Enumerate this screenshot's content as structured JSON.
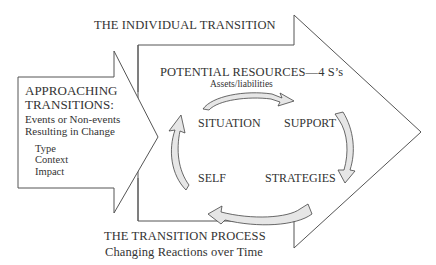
{
  "diagram": {
    "individual_transition": {
      "label": "THE INDIVIDUAL TRANSITION"
    },
    "approaching": {
      "title_line1": "APPROACHING",
      "title_line2": "TRANSITIONS:",
      "sub_line1": "Events or Non-events",
      "sub_line2": "Resulting in Change",
      "factors": [
        "Type",
        "Context",
        "Impact"
      ]
    },
    "resources": {
      "title": "POTENTIAL RESOURCES—4 S’s",
      "subtitle": "Assets/liabilities",
      "four_s": {
        "situation": "SITUATION",
        "support": "SUPPORT",
        "strategies": "STRATEGIES",
        "self": "SELF"
      }
    },
    "process": {
      "title": "THE TRANSITION PROCESS",
      "subtitle": "Changing Reactions over Time"
    },
    "colors": {
      "line": "#555555",
      "text": "#333333",
      "background": "#ffffff",
      "cycle_arrow_fill": "#e6e6e6"
    }
  }
}
